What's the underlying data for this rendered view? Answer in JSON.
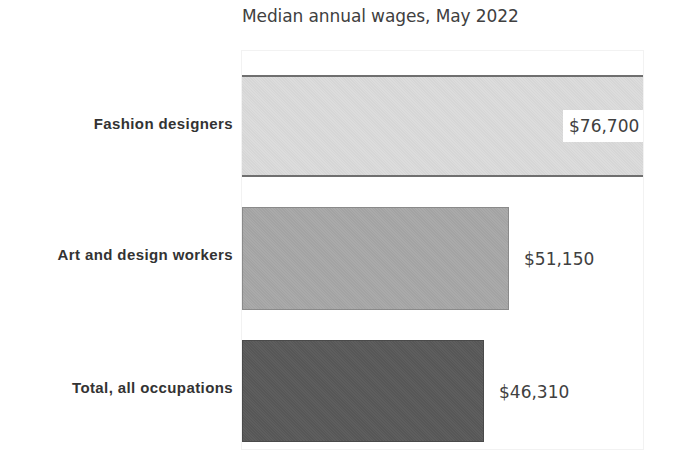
{
  "chart_data": {
    "type": "bar",
    "orientation": "horizontal",
    "title": "Median annual wages, May 2022",
    "categories": [
      "Fashion designers",
      "Art and design workers",
      "Total, all occupations"
    ],
    "values": [
      76700,
      51150,
      46310
    ],
    "value_labels": [
      "$76,700",
      "$51,150",
      "$46,310"
    ],
    "colors": [
      "#d9d9d9",
      "#a6a6a6",
      "#595959"
    ],
    "xlabel": "",
    "ylabel": "",
    "xlim": [
      0,
      76700
    ],
    "grid": false,
    "legend": null
  },
  "title": "Median annual wages, May 2022",
  "bars": [
    {
      "label": "Fashion designers",
      "value_label": "$76,700"
    },
    {
      "label": "Art and design workers",
      "value_label": "$51,150"
    },
    {
      "label": "Total, all occupations",
      "value_label": "$46,310"
    }
  ]
}
